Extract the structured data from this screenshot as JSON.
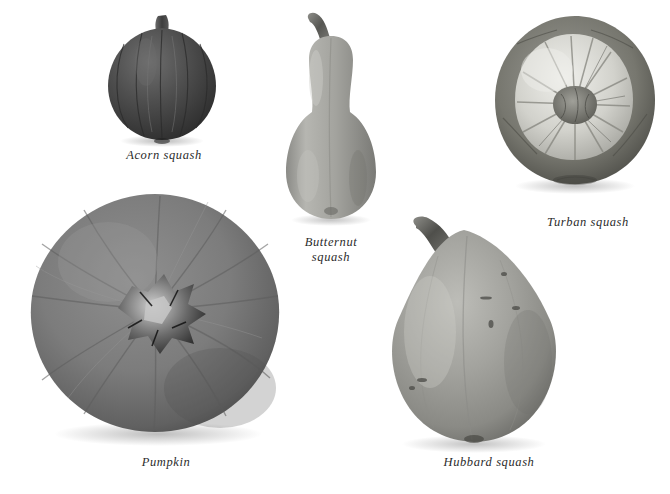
{
  "plate": {
    "title": "Squash varieties plate",
    "background_color": "#ffffff",
    "rendering": "grayscale photographic",
    "specimen_count": 5
  },
  "specimens": [
    {
      "id": "acorn-squash",
      "label": "Acorn squash",
      "shape": "acorn / teardrop with vertical ribs",
      "tone": "dark gray",
      "base_color": "#4a4a4a",
      "shadow_color": "#2a2a2a",
      "highlight_color": "#7d7d7d",
      "stem": "short thick stem at top",
      "position": "upper left"
    },
    {
      "id": "butternut-squash",
      "label": "Butternut\nsquash",
      "label_lines": [
        "Butternut",
        "squash"
      ],
      "shape": "bell / pear with elongated neck",
      "tone": "medium light gray",
      "base_color": "#9a9a96",
      "shadow_color": "#6d6d6a",
      "highlight_color": "#c9c9c4",
      "stem": "curved knobby stalk at top",
      "position": "upper center"
    },
    {
      "id": "turban-squash",
      "label": "Turban squash",
      "shape": "round with raised striped turban cap",
      "tone": "mixed dark rim, light center cap",
      "base_color": "#8d8d88",
      "shadow_color": "#5e5e5a",
      "highlight_color": "#e2e2dd",
      "stem": "knobby center crown",
      "position": "upper right"
    },
    {
      "id": "pumpkin",
      "label": "Pumpkin",
      "shape": "round, top view with radial ribs",
      "tone": "medium gray",
      "base_color": "#828282",
      "shadow_color": "#565656",
      "highlight_color": "#a6a6a6",
      "stem": "dark star-shaped stem scar at center",
      "position": "lower left"
    },
    {
      "id": "hubbard-squash",
      "label": "Hubbard squash",
      "shape": "onion / teardrop, pointed top",
      "tone": "light medium gray",
      "base_color": "#9e9e99",
      "shadow_color": "#6f6f6b",
      "highlight_color": "#cfcfca",
      "stem": "short dark stem at pointed top",
      "position": "lower right"
    }
  ]
}
